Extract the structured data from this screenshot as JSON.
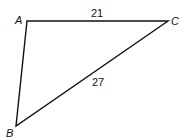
{
  "diagram": {
    "type": "triangle",
    "vertices": [
      {
        "id": "A",
        "label": "A"
      },
      {
        "id": "B",
        "label": "B"
      },
      {
        "id": "C",
        "label": "C"
      }
    ],
    "sides": [
      {
        "from": "A",
        "to": "C",
        "label": "21"
      },
      {
        "from": "B",
        "to": "C",
        "label": "27"
      },
      {
        "from": "A",
        "to": "B",
        "label": ""
      }
    ]
  }
}
